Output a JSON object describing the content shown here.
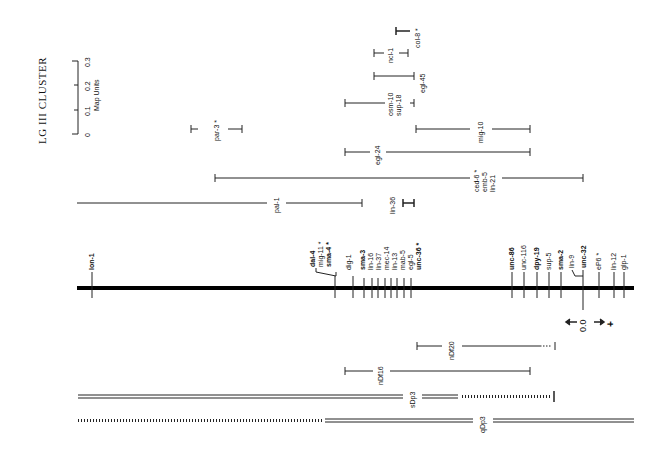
{
  "figure": {
    "title": "LG III CLUSTER",
    "scale_bar": {
      "label": "Map Units",
      "ticks": [
        "0",
        "0.1",
        "0.2",
        "0.3"
      ]
    },
    "orientation_marker": {
      "left": "–",
      "center": "0.0",
      "right": "+"
    },
    "chromosome": {
      "left_end_gene": "lon-1",
      "genes_left_group": [
        {
          "name": "dal-4",
          "bold": true,
          "star": false
        },
        {
          "name": "mig-11",
          "bold": false,
          "star": true
        },
        {
          "name": "sma-4",
          "bold": true,
          "star": true
        },
        {
          "name": "dig-1",
          "bold": false,
          "star": false
        },
        {
          "name": "sma-3",
          "bold": true,
          "star": false
        },
        {
          "name": "lin-16",
          "bold": false,
          "star": false
        },
        {
          "name": "lin-37",
          "bold": false,
          "star": false
        },
        {
          "name": "mec-14",
          "bold": false,
          "star": false
        },
        {
          "name": "lin-13",
          "bold": false,
          "star": false
        },
        {
          "name": "mab-5",
          "bold": false,
          "star": false
        },
        {
          "name": "egl-5",
          "bold": false,
          "star": false
        },
        {
          "name": "unc-36",
          "bold": true,
          "star": true
        }
      ],
      "genes_right_group": [
        {
          "name": "unc-86",
          "bold": true,
          "star": false
        },
        {
          "name": "unc-116",
          "bold": false,
          "star": false
        },
        {
          "name": "dpy-19",
          "bold": true,
          "star": false
        },
        {
          "name": "sup-5",
          "bold": false,
          "star": false
        },
        {
          "name": "sma-2",
          "bold": true,
          "star": false
        },
        {
          "name": "lin-9",
          "bold": false,
          "star": false
        },
        {
          "name": "unc-32",
          "bold": true,
          "star": false
        },
        {
          "name": "eP6",
          "bold": false,
          "star": true
        },
        {
          "name": "lin-12",
          "bold": false,
          "star": false
        },
        {
          "name": "glp-1",
          "bold": false,
          "star": false
        }
      ]
    },
    "intervals_above": [
      {
        "name": "col-8 *"
      },
      {
        "name": "ncl-1"
      },
      {
        "name": "egl-45"
      },
      {
        "name": "osm-10 / sup-18"
      },
      {
        "name": "par-3 *"
      },
      {
        "name": "mig-10"
      },
      {
        "name": "egl-24"
      },
      {
        "name": "ced-6 * / emb-5 / lin-21"
      },
      {
        "name": "pal-1"
      },
      {
        "name": "lin-36"
      }
    ],
    "intervals_below": [
      {
        "name": "nDf20"
      },
      {
        "name": "nDf16"
      },
      {
        "name": "sDp3"
      },
      {
        "name": "qDp3"
      }
    ]
  },
  "labels": {
    "title": "LG III CLUSTER",
    "map_units": "Map Units",
    "t0": "0",
    "t1": "0.1",
    "t2": "0.2",
    "t3": "0.3",
    "col8": "col-8 *",
    "ncl1": "ncl-1",
    "egl45": "egl-45",
    "osm10": "osm-10",
    "sup18": "sup-18",
    "par3": "par-3 *",
    "mig10": "mig-10",
    "egl24": "egl-24",
    "ced6": "ced-6 *",
    "emb5": "emb-5",
    "lin21": "lin-21",
    "pal1": "pal-1",
    "lin36": "lin-36",
    "lon1": "lon-1",
    "dal4": "dal-4",
    "mig11": "mig-11 *",
    "sma4": "sma-4 *",
    "dig1": "dig-1",
    "sma3": "sma-3",
    "lin16": "lin-16",
    "lin37": "lin-37",
    "mec14": "mec-14",
    "lin13": "lin-13",
    "mab5": "mab-5",
    "egl5": "egl-5",
    "unc36": "unc-36 *",
    "unc86": "unc-86",
    "unc116": "unc-116",
    "dpy19": "dpy-19",
    "sup5": "sup-5",
    "sma2": "sma-2",
    "lin9": "lin-9",
    "unc32": "unc-32",
    "ep6": "eP6 *",
    "lin12": "lin-12",
    "glp1": "glp-1",
    "zero": "0.0",
    "minus": "–",
    "plus": "+",
    "ndf20": "nDf20",
    "ndf16": "nDf16",
    "sdp3": "sDp3",
    "qdp3": "qDp3"
  }
}
